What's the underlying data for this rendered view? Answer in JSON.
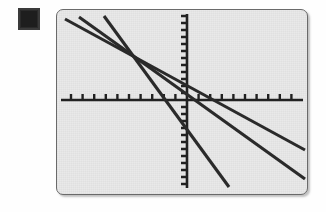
{
  "screen": {
    "label": "graphing-calculator-screen",
    "background_color": "#e9e9e9",
    "bezel_color": "#6a6a6a",
    "width": 252,
    "height": 186
  },
  "marker": {
    "name": "dark-square-marker",
    "color": "#2a2a2a"
  },
  "chart_data": {
    "type": "line",
    "title": "",
    "subtitle": "",
    "xlabel": "",
    "ylabel": "",
    "grid": false,
    "legend": "none",
    "axis_color": "#222222",
    "line_color": "#2b2b2b",
    "axes": {
      "x_axis_y_pixel": 90,
      "y_axis_x_pixel": 130,
      "x_tick_spacing_px": 11.6,
      "y_tick_spacing_px": 7.0,
      "x_tick_length_px": 6,
      "y_tick_length_px": 6,
      "x_tick_count": 21,
      "y_tick_count": 24,
      "xlim": [
        -11,
        11
      ],
      "ylim": [
        -13,
        12
      ]
    },
    "series": [
      {
        "name": "line-1-shallow",
        "slope": -0.55,
        "points_px": [
          [
            8,
            9
          ],
          [
            248,
            140
          ]
        ],
        "x": [
          -11,
          10.2
        ],
        "y": [
          9.8,
          -7.3
        ]
      },
      {
        "name": "line-2-medium",
        "slope": -0.74,
        "points_px": [
          [
            22,
            7
          ],
          [
            248,
            169
          ]
        ],
        "x": [
          -9.6,
          10.2
        ],
        "y": [
          10.2,
          -11.3
        ]
      },
      {
        "name": "line-3-steep",
        "slope": -1.55,
        "points_px": [
          [
            47,
            6
          ],
          [
            172,
            177
          ]
        ],
        "x": [
          -7.3,
          3.7
        ],
        "y": [
          10.5,
          -12.4
        ]
      }
    ],
    "intersection_region_px": [
      84,
      57
    ]
  }
}
